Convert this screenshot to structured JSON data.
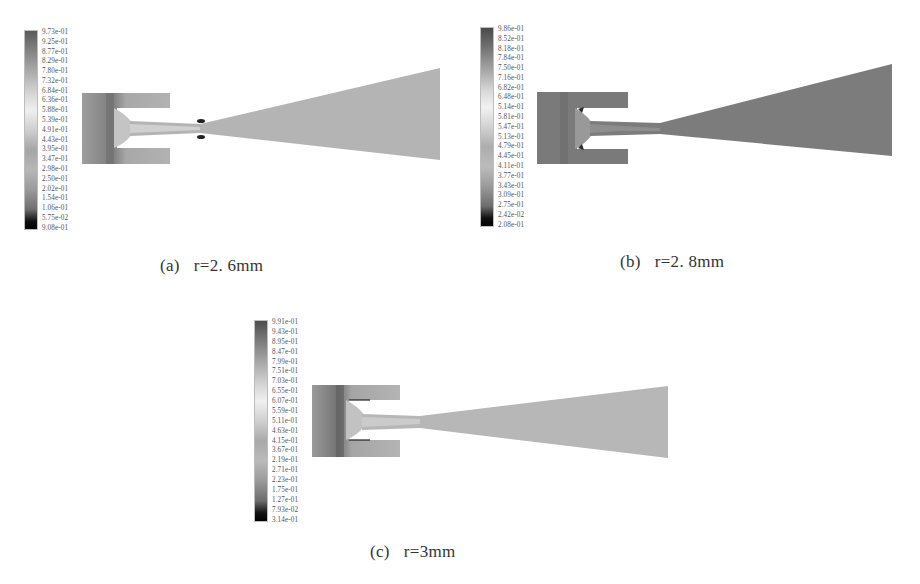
{
  "figure": {
    "panels": [
      {
        "id": "a",
        "caption_label": "(a)",
        "caption_value": "r=2. 6mm",
        "colorbar": [
          "9.73e-01",
          "9.25e-01",
          "8.77e-01",
          "8.29e-01",
          "7.80e-01",
          "7.32e-01",
          "6.84e-01",
          "6.36e-01",
          "5.88e-01",
          "5.39e-01",
          "4.91e-01",
          "4.43e-01",
          "3.95e-01",
          "3.47e-01",
          "2.98e-01",
          "2.50e-01",
          "2.02e-01",
          "1.54e-01",
          "1.06e-01",
          "5.75e-02",
          "9.08e-01"
        ]
      },
      {
        "id": "b",
        "caption_label": "(b)",
        "caption_value": "r=2. 8mm",
        "colorbar": [
          "9.86e-01",
          "8.52e-01",
          "8.18e-01",
          "7.84e-01",
          "7.50e-01",
          "7.16e-01",
          "6.82e-01",
          "6.48e-01",
          "5.14e-01",
          "5.81e-01",
          "5.47e-01",
          "5.13e-01",
          "4.79e-01",
          "4.45e-01",
          "4.11e-01",
          "3.77e-01",
          "3.43e-01",
          "3.09e-01",
          "2.75e-01",
          "2.42e-02",
          "2.08e-01"
        ]
      },
      {
        "id": "c",
        "caption_label": "(c)",
        "caption_value": "r=3mm",
        "colorbar": [
          "9.91e-01",
          "9.43e-01",
          "8.95e-01",
          "8.47e-01",
          "7.99e-01",
          "7.51e-01",
          "7.03e-01",
          "6.55e-01",
          "6.07e-01",
          "5.59e-01",
          "5.11e-01",
          "4.63e-01",
          "4.15e-01",
          "3.67e-01",
          "2.19e-01",
          "2.71e-01",
          "2.23e-01",
          "1.75e-01",
          "1.27e-01",
          "7.93e-02",
          "3.14e-01"
        ]
      }
    ]
  }
}
